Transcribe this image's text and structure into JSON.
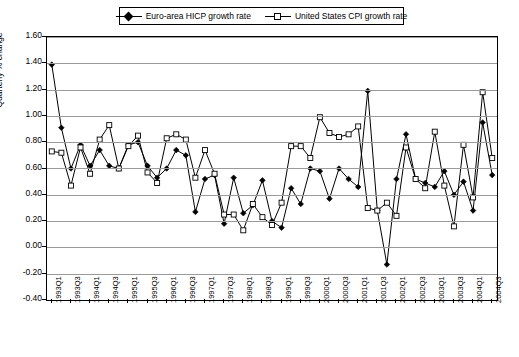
{
  "legend": {
    "entries": [
      {
        "label": "Euro-area HICP growth rate",
        "marker": "diamond-marker"
      },
      {
        "label": "United States CPI growth rate",
        "marker": "square-marker"
      }
    ]
  },
  "chart_data": {
    "type": "line",
    "title": "",
    "xlabel": "",
    "ylabel": "Quarterly % change",
    "ylim": [
      -0.4,
      1.6
    ],
    "ytick_step": 0.2,
    "ytick_labels": [
      "1.60",
      "1.40",
      "1.20",
      "1.00",
      "0.80",
      "0.60",
      "0.40",
      "0.20",
      "0.00",
      "-0.20",
      "-0.40"
    ],
    "grid": true,
    "legend_position": "top",
    "categories": [
      "1993Q1",
      "1993Q2",
      "1993Q3",
      "1993Q4",
      "1994Q1",
      "1994Q2",
      "1994Q3",
      "1994Q4",
      "1995Q1",
      "1995Q2",
      "1995Q3",
      "1995Q4",
      "1996Q1",
      "1996Q2",
      "1996Q3",
      "1996Q4",
      "1997Q1",
      "1997Q2",
      "1997Q3",
      "1997Q4",
      "1998Q1",
      "1998Q2",
      "1998Q3",
      "1998Q4",
      "1999Q1",
      "1999Q2",
      "1999Q3",
      "1999Q4",
      "2000Q1",
      "2000Q2",
      "2000Q3",
      "2000Q4",
      "2001Q1",
      "2001Q2",
      "2001Q3",
      "2001Q4",
      "2002Q1",
      "2002Q2",
      "2002Q3",
      "2002Q4",
      "2003Q1",
      "2003Q2",
      "2003Q3",
      "2003Q4",
      "2004Q1",
      "2004Q2",
      "2004Q3"
    ],
    "xtick_labels": [
      "1993Q1",
      "1993Q3",
      "1994Q1",
      "1994Q3",
      "1995Q1",
      "1995Q3",
      "1996Q1",
      "1996Q3",
      "1997Q1",
      "1997Q3",
      "1998Q1",
      "1998Q3",
      "1999Q1",
      "1999Q3",
      "2000Q1",
      "2000Q3",
      "2001Q1",
      "2001Q3",
      "2002Q1",
      "2002Q3",
      "2003Q1",
      "2003Q3",
      "2004Q1",
      "2004Q3"
    ],
    "series": [
      {
        "name": "Euro-area HICP growth rate",
        "marker": "diamond",
        "values": [
          1.39,
          0.91,
          0.6,
          0.78,
          0.62,
          0.74,
          0.62,
          0.6,
          0.78,
          0.8,
          0.62,
          0.53,
          0.6,
          0.74,
          0.7,
          0.27,
          0.52,
          0.55,
          0.18,
          0.53,
          0.26,
          0.32,
          0.51,
          0.2,
          0.15,
          0.45,
          0.33,
          0.6,
          0.58,
          0.37,
          0.6,
          0.52,
          0.46,
          1.19,
          0.28,
          -0.13,
          0.52,
          0.86,
          0.52,
          0.49,
          0.46,
          0.58,
          0.4,
          0.5,
          0.28,
          0.95,
          0.55
        ]
      },
      {
        "name": "United States CPI growth rate",
        "marker": "square",
        "values": [
          0.73,
          0.72,
          0.47,
          0.76,
          0.56,
          0.82,
          0.93,
          0.6,
          0.77,
          0.85,
          0.57,
          0.49,
          0.83,
          0.86,
          0.82,
          0.53,
          0.74,
          0.56,
          0.25,
          0.25,
          0.13,
          0.33,
          0.23,
          0.17,
          0.34,
          0.77,
          0.77,
          0.68,
          0.99,
          0.87,
          0.84,
          0.86,
          0.92,
          0.3,
          0.28,
          0.34,
          0.24,
          0.76,
          0.52,
          0.45,
          0.88,
          0.47,
          0.16,
          0.78,
          0.38,
          1.18,
          0.68
        ]
      }
    ]
  }
}
